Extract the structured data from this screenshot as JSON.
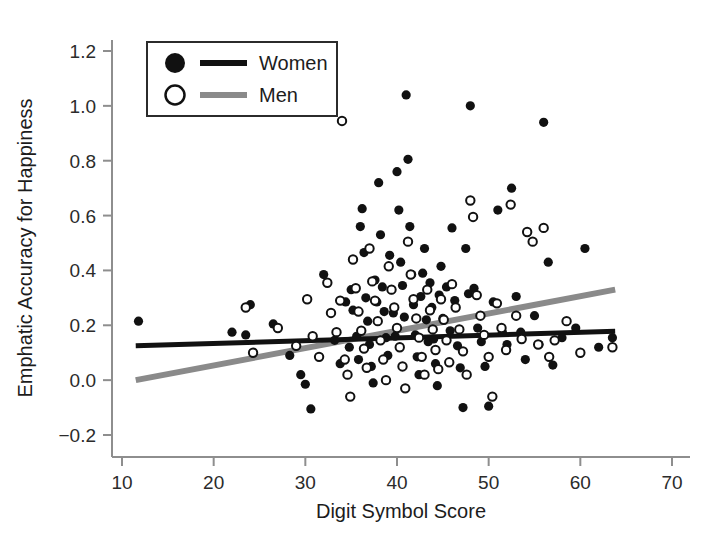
{
  "chart_data": {
    "type": "scatter",
    "title": "",
    "xlabel": "Digit Symbol Score",
    "ylabel": "Emphatic Accuracy for Happiness",
    "xlim": [
      6,
      73
    ],
    "ylim": [
      -0.28,
      1.29
    ],
    "xticks": [
      10,
      20,
      30,
      40,
      50,
      60,
      70
    ],
    "xtick_labels": [
      "10",
      "20",
      "30",
      "40",
      "50",
      "60",
      "70"
    ],
    "yticks": [
      -0.2,
      0.0,
      0.2,
      0.4,
      0.6,
      0.8,
      1.0,
      1.2
    ],
    "ytick_labels": [
      "−0.2",
      "0.0",
      "0.2",
      "0.4",
      "0.6",
      "0.8",
      "1.0",
      "1.2"
    ],
    "grid": false,
    "legend_position": "upper-left-inside",
    "legend": [
      {
        "name": "Women",
        "marker": "filled-circle",
        "marker_color": "#111111",
        "line_color": "#111111"
      },
      {
        "name": "Men",
        "marker": "open-circle",
        "marker_color": "#111111",
        "line_color": "#8a8a8a"
      }
    ],
    "series": [
      {
        "name": "Women",
        "marker": "filled-circle",
        "color": "#111111",
        "points": [
          [
            11.8,
            0.215
          ],
          [
            22.0,
            0.175
          ],
          [
            23.5,
            0.165
          ],
          [
            24.0,
            0.275
          ],
          [
            26.5,
            0.205
          ],
          [
            28.3,
            0.09
          ],
          [
            29.5,
            0.02
          ],
          [
            30.0,
            -0.015
          ],
          [
            30.6,
            -0.105
          ],
          [
            32.0,
            0.385
          ],
          [
            33.2,
            0.145
          ],
          [
            33.8,
            0.06
          ],
          [
            34.4,
            0.285
          ],
          [
            34.8,
            0.12
          ],
          [
            35.0,
            0.33
          ],
          [
            35.2,
            0.255
          ],
          [
            35.6,
            0.16
          ],
          [
            35.8,
            0.075
          ],
          [
            36.0,
            0.56
          ],
          [
            36.2,
            0.625
          ],
          [
            36.4,
            0.465
          ],
          [
            36.6,
            0.3
          ],
          [
            36.8,
            0.215
          ],
          [
            37.0,
            0.13
          ],
          [
            37.2,
            0.05
          ],
          [
            37.4,
            -0.01
          ],
          [
            37.6,
            0.365
          ],
          [
            37.8,
            0.285
          ],
          [
            38.0,
            0.72
          ],
          [
            38.2,
            0.53
          ],
          [
            38.4,
            0.34
          ],
          [
            38.6,
            0.25
          ],
          [
            38.8,
            0.155
          ],
          [
            39.0,
            0.09
          ],
          [
            39.2,
            0.455
          ],
          [
            39.4,
            0.33
          ],
          [
            39.6,
            0.245
          ],
          [
            39.8,
            0.16
          ],
          [
            40.0,
            0.76
          ],
          [
            40.2,
            0.62
          ],
          [
            40.4,
            0.43
          ],
          [
            40.6,
            0.345
          ],
          [
            40.8,
            0.23
          ],
          [
            41.0,
            1.04
          ],
          [
            41.2,
            0.805
          ],
          [
            41.4,
            0.56
          ],
          [
            41.6,
            0.385
          ],
          [
            41.8,
            0.275
          ],
          [
            42.0,
            0.165
          ],
          [
            42.2,
            0.085
          ],
          [
            42.4,
            0.02
          ],
          [
            42.6,
            0.305
          ],
          [
            42.8,
            0.39
          ],
          [
            43.0,
            0.48
          ],
          [
            43.2,
            0.22
          ],
          [
            43.4,
            0.14
          ],
          [
            43.6,
            0.355
          ],
          [
            43.8,
            0.265
          ],
          [
            44.0,
            0.15
          ],
          [
            44.2,
            0.06
          ],
          [
            44.4,
            -0.02
          ],
          [
            44.6,
            0.31
          ],
          [
            44.8,
            0.415
          ],
          [
            45.0,
            0.225
          ],
          [
            45.4,
            0.34
          ],
          [
            45.8,
            0.18
          ],
          [
            46.0,
            0.555
          ],
          [
            46.3,
            0.29
          ],
          [
            46.6,
            0.125
          ],
          [
            46.9,
            0.045
          ],
          [
            47.2,
            -0.1
          ],
          [
            47.5,
            0.48
          ],
          [
            47.8,
            0.315
          ],
          [
            48.0,
            1.0
          ],
          [
            48.4,
            0.335
          ],
          [
            48.8,
            0.19
          ],
          [
            49.2,
            0.14
          ],
          [
            49.6,
            0.05
          ],
          [
            50.0,
            -0.095
          ],
          [
            50.5,
            0.285
          ],
          [
            51.0,
            0.62
          ],
          [
            51.5,
            0.175
          ],
          [
            52.0,
            0.13
          ],
          [
            52.5,
            0.7
          ],
          [
            53.0,
            0.305
          ],
          [
            53.5,
            0.175
          ],
          [
            54.0,
            0.075
          ],
          [
            55.0,
            0.235
          ],
          [
            55.5,
            0.13
          ],
          [
            56.0,
            0.94
          ],
          [
            56.5,
            0.43
          ],
          [
            57.0,
            0.055
          ],
          [
            58.0,
            0.155
          ],
          [
            59.5,
            0.19
          ],
          [
            60.5,
            0.48
          ],
          [
            62.0,
            0.12
          ],
          [
            63.5,
            0.155
          ]
        ]
      },
      {
        "name": "Men",
        "marker": "open-circle",
        "color": "#111111",
        "points": [
          [
            23.5,
            0.265
          ],
          [
            24.3,
            0.1
          ],
          [
            27.0,
            0.19
          ],
          [
            29.0,
            0.125
          ],
          [
            30.2,
            0.295
          ],
          [
            30.8,
            0.16
          ],
          [
            31.5,
            0.085
          ],
          [
            32.4,
            0.355
          ],
          [
            32.8,
            0.245
          ],
          [
            33.4,
            0.175
          ],
          [
            33.8,
            0.29
          ],
          [
            34.0,
            0.945
          ],
          [
            34.3,
            0.075
          ],
          [
            34.6,
            0.02
          ],
          [
            34.9,
            -0.06
          ],
          [
            35.2,
            0.44
          ],
          [
            35.5,
            0.335
          ],
          [
            35.8,
            0.25
          ],
          [
            36.1,
            0.18
          ],
          [
            36.4,
            0.115
          ],
          [
            36.7,
            0.045
          ],
          [
            37.0,
            0.48
          ],
          [
            37.3,
            0.36
          ],
          [
            37.6,
            0.29
          ],
          [
            37.9,
            0.215
          ],
          [
            38.2,
            0.145
          ],
          [
            38.5,
            0.075
          ],
          [
            38.8,
            0.0
          ],
          [
            39.1,
            0.415
          ],
          [
            39.4,
            0.33
          ],
          [
            39.7,
            0.265
          ],
          [
            40.0,
            0.19
          ],
          [
            40.3,
            0.12
          ],
          [
            40.6,
            0.05
          ],
          [
            40.9,
            -0.03
          ],
          [
            41.2,
            0.505
          ],
          [
            41.5,
            0.385
          ],
          [
            41.8,
            0.295
          ],
          [
            42.1,
            0.225
          ],
          [
            42.4,
            0.155
          ],
          [
            42.7,
            0.085
          ],
          [
            43.0,
            0.02
          ],
          [
            43.3,
            0.33
          ],
          [
            43.6,
            0.255
          ],
          [
            43.9,
            0.185
          ],
          [
            44.2,
            0.11
          ],
          [
            44.5,
            0.04
          ],
          [
            44.8,
            0.295
          ],
          [
            45.1,
            0.22
          ],
          [
            45.4,
            0.145
          ],
          [
            45.7,
            0.065
          ],
          [
            46.0,
            0.35
          ],
          [
            46.4,
            0.265
          ],
          [
            46.8,
            0.185
          ],
          [
            47.2,
            0.105
          ],
          [
            47.6,
            0.02
          ],
          [
            48.0,
            0.655
          ],
          [
            48.3,
            0.595
          ],
          [
            48.7,
            0.31
          ],
          [
            49.1,
            0.235
          ],
          [
            49.5,
            0.165
          ],
          [
            50.0,
            0.085
          ],
          [
            50.4,
            -0.06
          ],
          [
            50.9,
            0.28
          ],
          [
            51.4,
            0.19
          ],
          [
            51.9,
            0.11
          ],
          [
            52.4,
            0.64
          ],
          [
            53.0,
            0.235
          ],
          [
            53.6,
            0.15
          ],
          [
            54.2,
            0.54
          ],
          [
            54.8,
            0.505
          ],
          [
            55.4,
            0.13
          ],
          [
            56.0,
            0.555
          ],
          [
            56.6,
            0.085
          ],
          [
            57.2,
            0.145
          ],
          [
            58.5,
            0.215
          ],
          [
            60.0,
            0.1
          ],
          [
            63.5,
            0.12
          ]
        ]
      }
    ],
    "trend_lines": [
      {
        "name": "Women",
        "color": "#111111",
        "width": 5,
        "x_start": 11.5,
        "y_start": 0.125,
        "x_end": 63.8,
        "y_end": 0.178
      },
      {
        "name": "Men",
        "color": "#8a8a8a",
        "width": 6,
        "x_start": 11.5,
        "y_start": 0.0,
        "x_end": 63.8,
        "y_end": 0.33
      }
    ]
  },
  "axes": {
    "x_title": "Digit Symbol Score",
    "y_title": "Emphatic Accuracy for Happiness"
  },
  "legend": {
    "items": [
      {
        "label": "Women"
      },
      {
        "label": "Men"
      }
    ]
  }
}
